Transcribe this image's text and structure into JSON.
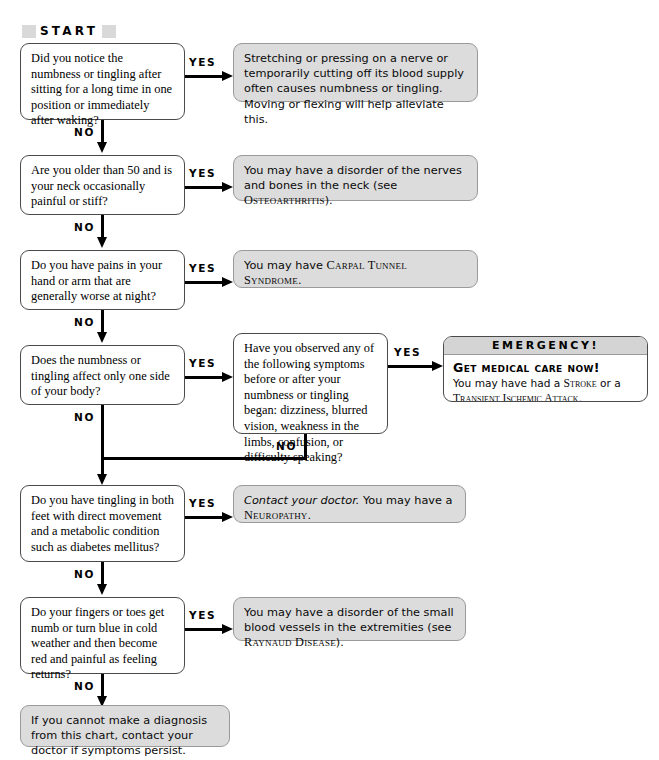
{
  "chart": {
    "start_label": "START",
    "yes_label": "YES",
    "no_label": "NO"
  },
  "questions": {
    "q1": "Did you notice the numbness or tingling after sitting for a long time in one position or immediately after waking?",
    "q2": "Are you older than 50 and is your neck occasionally painful or stiff?",
    "q3": "Do you have pains in your hand or arm that are generally worse at night?",
    "q4": "Does the numbness or tingling affect only one side of your body?",
    "q5": "Have you observed any of the following symptoms before or after your numbness or tingling began: dizziness, blurred vision, weakness in the limbs, confusion, or difficulty speaking?",
    "q6": "Do you have tingling in both feet with direct movement and a metabolic condition such as diabetes mellitus?",
    "q7": "Do your fingers or toes get numb or turn blue in cold weather and then become red and painful as feeling returns?"
  },
  "answers": {
    "a1": "Stretching or pressing on a nerve or temporarily cutting off its blood supply often causes numbness or tingling. Moving or flexing will help alleviate this.",
    "a2_pre": "You may have a disorder of the nerves and bones in the neck (see ",
    "a2_term": "Osteoarthritis",
    "a2_post": ").",
    "a3_pre": "You may have ",
    "a3_term": "Carpal Tunnel Syndrome",
    "a3_post": ".",
    "a6_ital": "Contact your doctor.",
    "a6_pre": " You may have a ",
    "a6_term": "Neuropathy",
    "a6_post": ".",
    "a7_pre": "You may have a disorder of the small blood vessels in the extremities (see ",
    "a7_term": "Raynaud Disease",
    "a7_post": ").",
    "a8": "If you cannot make a diagnosis from this chart, contact your doctor if symptoms persist."
  },
  "emergency": {
    "header": "EMERGENCY!",
    "heading": "Get medical care now!",
    "body_pre": "You may have had a ",
    "term1": "Stroke",
    "body_mid": " or a ",
    "term2": "Transient Ischemic Attack",
    "body_post": "."
  },
  "colors": {
    "answer_fill": "#dcdcdc",
    "emergency_header": "#d4d4d4",
    "start_band": "#d9d9d9",
    "line": "#000000"
  }
}
